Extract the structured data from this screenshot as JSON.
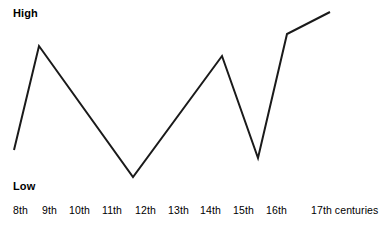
{
  "chart_data": {
    "type": "line",
    "title": "",
    "xlabel": "",
    "ylabel": "",
    "x_axis_unit": "centuries",
    "categories": [
      "8th",
      "9th",
      "10th",
      "11th",
      "12th",
      "13th",
      "14th",
      "15th",
      "16th",
      "17th"
    ],
    "tick_labels": [
      "8th",
      "9th",
      "10th",
      "11th",
      "12th",
      "13th",
      "14th",
      "15th",
      "16th",
      "17th"
    ],
    "tick_suffix": "centuries",
    "y_axis_qualitative": true,
    "y_low_label": "Low",
    "y_high_label": "High",
    "ylim": [
      0,
      100
    ],
    "grid": false,
    "legend": false,
    "line_color": "#1a1a1a",
    "line_width": 2,
    "vertices": [
      {
        "century": "8th",
        "x": 14,
        "y": 150,
        "value": 22
      },
      {
        "century": "9th",
        "x": 39,
        "y": 46,
        "value": 79
      },
      {
        "century": "11th",
        "x": 133,
        "y": 177,
        "value": 7
      },
      {
        "century": "14th",
        "x": 222,
        "y": 56,
        "value": 73
      },
      {
        "century": "15th",
        "x": 258,
        "y": 158,
        "value": 17
      },
      {
        "century": "16th",
        "x": 287,
        "y": 34,
        "value": 86
      },
      {
        "century": "17th",
        "x": 330,
        "y": 12,
        "value": 98
      }
    ],
    "series": [
      {
        "name": "",
        "x": [
          "8th",
          "9th",
          "11th",
          "14th",
          "15th",
          "16th",
          "17th"
        ],
        "values": [
          22,
          79,
          7,
          73,
          17,
          86,
          98
        ]
      }
    ],
    "annotations": []
  },
  "ticks": [
    {
      "label": "8th",
      "x": 13
    },
    {
      "label": "9th",
      "x": 42
    },
    {
      "label": "10th",
      "x": 69
    },
    {
      "label": "11th",
      "x": 102
    },
    {
      "label": "12th",
      "x": 135
    },
    {
      "label": "13th",
      "x": 168
    },
    {
      "label": "14th",
      "x": 200
    },
    {
      "label": "15th",
      "x": 233
    },
    {
      "label": "16th",
      "x": 266
    },
    {
      "label": "17th",
      "x": 311,
      "suffix": "centuries"
    }
  ],
  "axis_labels": {
    "high": "High",
    "low": "Low"
  }
}
